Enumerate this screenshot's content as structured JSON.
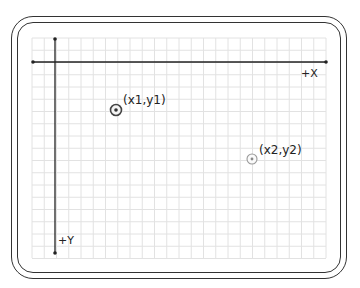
{
  "diagram": {
    "axes": {
      "x_label": "+X",
      "y_label": "+Y"
    },
    "points": [
      {
        "label": "(x1,y1)",
        "style": "dark"
      },
      {
        "label": "(x2,y2)",
        "style": "light"
      }
    ],
    "colors": {
      "frame": "#333333",
      "grid": "#e0e0e0",
      "axis": "#222222",
      "point_dark": "#444444",
      "point_light": "#999999"
    }
  }
}
